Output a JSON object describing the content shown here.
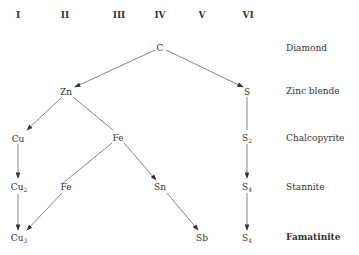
{
  "columns": [
    "I",
    "II",
    "III",
    "IV",
    "V",
    "VI"
  ],
  "rows": [
    "Diamond",
    "Zinc blende",
    "Chalcopyrite",
    "Stannite",
    "Famatinite"
  ],
  "nodes": {
    "c": {
      "el": "C"
    },
    "zn": {
      "el": "Zn"
    },
    "s1": {
      "el": "S"
    },
    "cu1": {
      "el": "Cu"
    },
    "fe1": {
      "el": "Fe"
    },
    "s2": {
      "el": "S",
      "sub": "2"
    },
    "cu2": {
      "el": "Cu",
      "sub": "2"
    },
    "fe2": {
      "el": "Fe"
    },
    "sn": {
      "el": "Sn"
    },
    "s4a": {
      "el": "S",
      "sub": "4"
    },
    "cu3": {
      "el": "Cu",
      "sub": "3"
    },
    "sb": {
      "el": "Sb"
    },
    "s4b": {
      "el": "S",
      "sub": "4"
    }
  },
  "colors": {
    "line": "#555555",
    "text": "#333333"
  }
}
